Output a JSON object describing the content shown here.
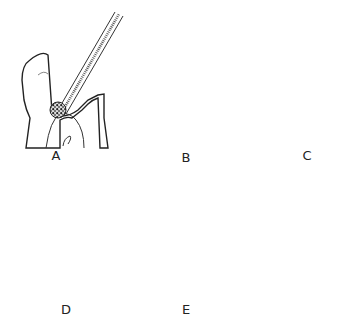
{
  "figure": {
    "panels": [
      {
        "id": "A",
        "label": "A",
        "x": 56,
        "y": 148,
        "content": "tooth with bur instrument removing decay"
      },
      {
        "id": "B",
        "label": "B",
        "x": 186,
        "y": 150,
        "content": "tooth with stippled crown area and dark decayed region"
      },
      {
        "id": "C",
        "label": "C",
        "x": 307,
        "y": 148,
        "content": "prepared tooth with cavity"
      },
      {
        "id": "D",
        "label": "D",
        "x": 66,
        "y": 302,
        "content": "tooth with light-stippled filling in cavity"
      },
      {
        "id": "E",
        "label": "E",
        "x": 186,
        "y": 302,
        "content": "tooth with full dark-stippled crown"
      }
    ],
    "colors": {
      "line": "#222222",
      "light_fill": "#d8d8d8",
      "dark_fill": "#555555",
      "background": "#ffffff"
    }
  }
}
